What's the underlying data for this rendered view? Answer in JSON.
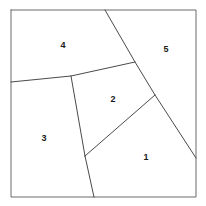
{
  "figure": {
    "top_partial_text": "",
    "canvas": {
      "width": 206,
      "height": 206
    },
    "background_color": "#ffffff",
    "line_color": "#4a4a4a",
    "frame_color": "#6a6a6a",
    "label_color": "#1a1a1a"
  },
  "frame": {
    "name": "outer-square",
    "x": 11,
    "y": 10,
    "width": 185,
    "height": 187,
    "points": "11,10 196,10 196,197 11,197 11,10"
  },
  "regions": [
    {
      "id": "region-1",
      "label": "1",
      "label_x": 146,
      "label_y": 158,
      "polygon": "85,156 155,95 196,158 196,197 94,197"
    },
    {
      "id": "region-2",
      "label": "2",
      "label_x": 113,
      "label_y": 100,
      "polygon": "71,76 135,62 155,95 85,156"
    },
    {
      "id": "region-3",
      "label": "3",
      "label_x": 44,
      "label_y": 139,
      "polygon": "11,82 71,76 85,156 94,197 11,197"
    },
    {
      "id": "region-4",
      "label": "4",
      "label_x": 63,
      "label_y": 46,
      "polygon": "11,10 105,10 135,62 71,76 11,82"
    },
    {
      "id": "region-5",
      "label": "5",
      "label_x": 166,
      "label_y": 50,
      "polygon": "105,10 196,10 196,158 155,95 135,62"
    }
  ],
  "edges": [
    {
      "id": "edge-top-to-center",
      "name": "boundary-4-5-and-2-5",
      "points": "105,10 135,62 155,95 196,158"
    },
    {
      "id": "edge-left-to-center",
      "name": "boundary-4-3-and-4-2",
      "points": "11,82 71,76 135,62"
    },
    {
      "id": "edge-3-2",
      "name": "boundary-3-2",
      "points": "71,76 85,156"
    },
    {
      "id": "edge-2-1",
      "name": "boundary-2-1",
      "points": "85,156 155,95"
    },
    {
      "id": "edge-3-1",
      "name": "boundary-3-1",
      "points": "85,156 94,197"
    }
  ]
}
